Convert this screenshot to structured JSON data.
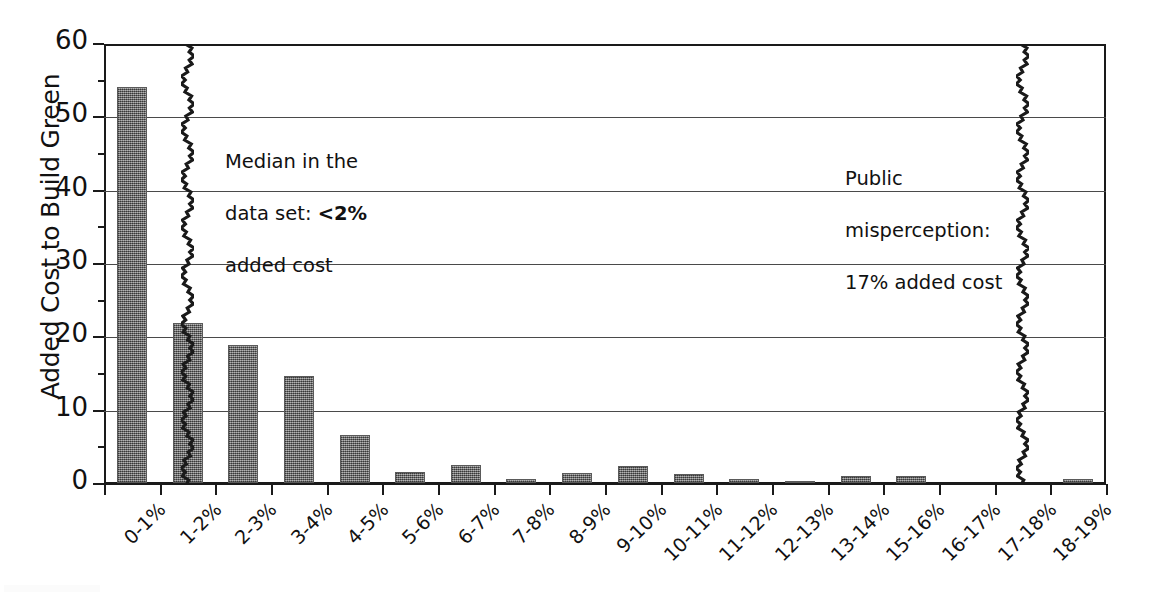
{
  "chart_data": {
    "type": "bar",
    "title": "",
    "subtitle": "",
    "xlabel": "",
    "ylabel": "Added Cost to Build Green",
    "ylim": [
      0,
      60
    ],
    "ytick_step": 10,
    "ytick_labels": [
      "60",
      "50",
      "40",
      "30",
      "20",
      "10",
      "0"
    ],
    "ytick_values": [
      60,
      50,
      40,
      30,
      20,
      10,
      0
    ],
    "grid": true,
    "grid_axis": "y",
    "legend": false,
    "legend_position": "none",
    "categories": [
      "0-1%",
      "1-2%",
      "2-3%",
      "3-4%",
      "4-5%",
      "5-6%",
      "6-7%",
      "7-8%",
      "8-9%",
      "9-10%",
      "10-11%",
      "11-12%",
      "12-13%",
      "13-14%",
      "15-16%",
      "16-17%",
      "17-18%",
      "18-19%"
    ],
    "values": [
      54,
      21.8,
      18.8,
      14.6,
      6.6,
      1.5,
      2.5,
      0.6,
      1.3,
      2.3,
      1.2,
      0.5,
      0.3,
      1.0,
      1.0,
      0.0,
      0.0,
      0.5
    ],
    "bar_color": "#6e6e6e",
    "annotations": [
      {
        "id": "median-annotation",
        "text_line1": "Median in the",
        "text_line2_prefix": "data set: ",
        "text_line2_bold": "<2%",
        "text_line3": "added cost",
        "marker_category": "1-2%",
        "marker_value": "<2%"
      },
      {
        "id": "misperception-annotation",
        "text_line1": "Public",
        "text_line2": "misperception:",
        "text_line3": "17% added cost",
        "marker_category": "17-18%",
        "marker_value": "17%"
      }
    ]
  },
  "axis": {
    "y_title": "Added Cost to Build Green",
    "y_ticks": [
      "60",
      "50",
      "40",
      "30",
      "20",
      "10",
      "0"
    ]
  },
  "annotations": {
    "median": {
      "line1": "Median in the",
      "line2_prefix": "data set: ",
      "line2_bold": "<2%",
      "line3": "added cost"
    },
    "misperception": {
      "line1": "Public",
      "line2": "misperception:",
      "line3": "17% added cost"
    }
  }
}
